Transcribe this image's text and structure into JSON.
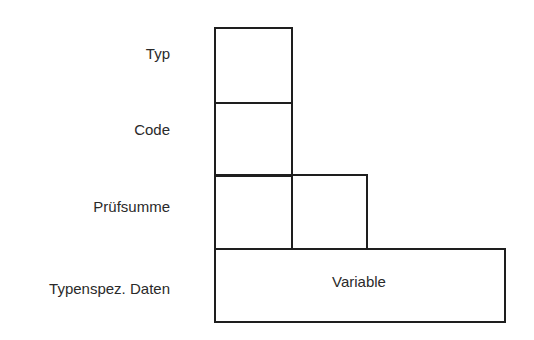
{
  "diagram": {
    "type": "packet-format",
    "rows": [
      {
        "label": "Typ",
        "cells": 1
      },
      {
        "label": "Code",
        "cells": 1
      },
      {
        "label": "Prüfsumme",
        "cells": 2
      },
      {
        "label": "Typenspez. Daten",
        "cells": 1,
        "content": "Variable"
      }
    ],
    "colors": {
      "line": "#1e1e1e",
      "text": "#2a2a2a",
      "background": "#ffffff"
    }
  }
}
